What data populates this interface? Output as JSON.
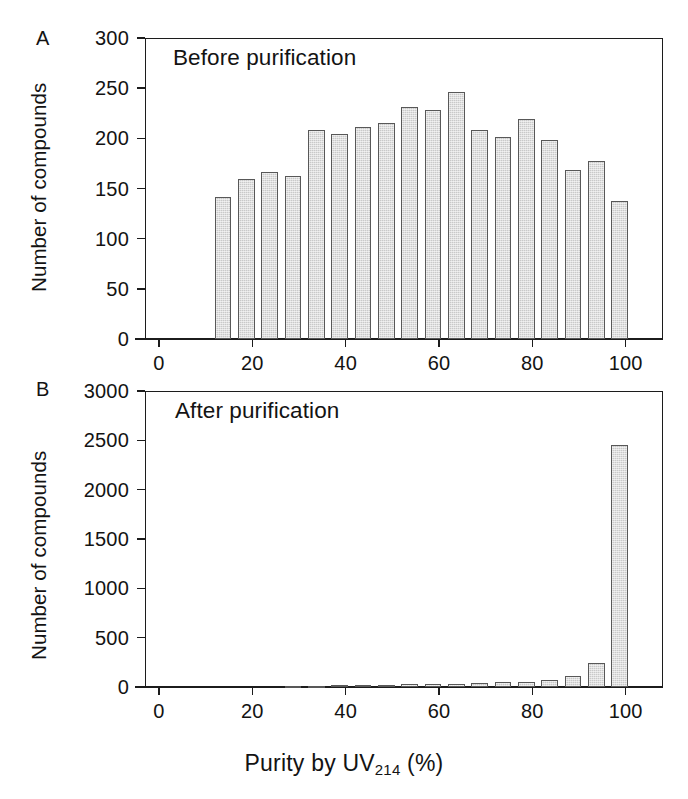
{
  "figure": {
    "x_axis_caption_prefix": "Purity by UV",
    "x_axis_caption_subscript": "214",
    "x_axis_caption_suffix": " (%)",
    "bar_fill_color": "#c9c9c9",
    "bar_edge_color": "#585858",
    "axis_color": "#1c1c1c"
  },
  "panelA": {
    "letter": "A",
    "title": "Before purification",
    "y_axis_title": "Number of compounds",
    "y_ticks": [
      "0",
      "50",
      "100",
      "150",
      "200",
      "250",
      "300"
    ],
    "x_ticks": [
      "0",
      "20",
      "40",
      "60",
      "80",
      "100"
    ]
  },
  "panelB": {
    "letter": "B",
    "title": "After purification",
    "y_axis_title": "Number of compounds",
    "y_ticks": [
      "0",
      "500",
      "1000",
      "1500",
      "2000",
      "2500",
      "3000"
    ],
    "x_ticks": [
      "0",
      "20",
      "40",
      "60",
      "80",
      "100"
    ]
  },
  "chart_data": [
    {
      "type": "bar",
      "panel": "A",
      "title": "Before purification",
      "xlabel": "Purity by UV214 (%)",
      "ylabel": "Number of compounds",
      "xlim": [
        -3,
        108
      ],
      "ylim": [
        0,
        300
      ],
      "yticks": [
        0,
        50,
        100,
        150,
        200,
        250,
        300
      ],
      "xticks": [
        0,
        20,
        40,
        60,
        80,
        100
      ],
      "grid": false,
      "legend": false,
      "bin_width": 5,
      "categories": [
        15,
        20,
        25,
        30,
        35,
        40,
        45,
        50,
        55,
        60,
        65,
        70,
        75,
        80,
        85,
        90,
        95,
        100
      ],
      "values": [
        142,
        159,
        166,
        162,
        208,
        204,
        211,
        215,
        231,
        228,
        246,
        208,
        201,
        219,
        198,
        168,
        177,
        138
      ]
    },
    {
      "type": "bar",
      "panel": "B",
      "title": "After purification",
      "xlabel": "Purity by UV214 (%)",
      "ylabel": "Number of compounds",
      "xlim": [
        -3,
        108
      ],
      "ylim": [
        0,
        3000
      ],
      "yticks": [
        0,
        500,
        1000,
        1500,
        2000,
        2500,
        3000
      ],
      "xticks": [
        0,
        20,
        40,
        60,
        80,
        100
      ],
      "grid": false,
      "legend": false,
      "bin_width": 5,
      "categories": [
        15,
        20,
        25,
        30,
        35,
        40,
        45,
        50,
        55,
        60,
        65,
        70,
        75,
        80,
        85,
        90,
        95,
        100
      ],
      "values": [
        0,
        0,
        0,
        12,
        14,
        18,
        22,
        24,
        26,
        30,
        34,
        40,
        46,
        52,
        68,
        108,
        245,
        2455
      ]
    }
  ]
}
